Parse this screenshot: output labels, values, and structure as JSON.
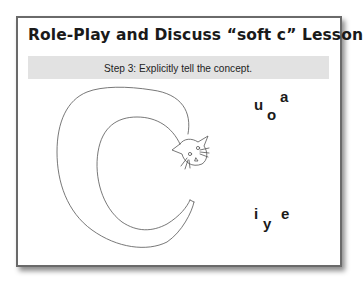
{
  "slide": {
    "title": "Role-Play and Discuss “soft c” Lesson",
    "step": "Step 3: Explicitly tell the concept.",
    "illustration": "cat-curled-into-letter-c",
    "hard_vowels": [
      "u",
      "o",
      "a"
    ],
    "soft_vowels": [
      "i",
      "y",
      "e"
    ]
  }
}
